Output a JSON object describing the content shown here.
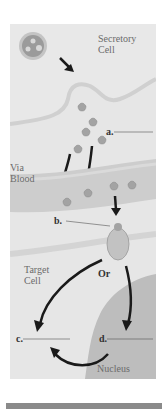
{
  "diagram": {
    "labels": {
      "secretory_cell_line1": "Secretory",
      "secretory_cell_line2": "Cell",
      "via_blood_line1": "Via",
      "via_blood_line2": "Blood",
      "target_cell_line1": "Target",
      "target_cell_line2": "Cell",
      "or": "Or",
      "nucleus": "Nucleus"
    },
    "blanks": {
      "a": "a.",
      "b": "b.",
      "c": "c.",
      "d": "d."
    },
    "colors": {
      "background": "#e6e6e6",
      "membrane": "#d2d2d2",
      "blood_vessel": "#cfcfcf",
      "nucleus": "#bdbdbd",
      "arrow": "#1a1a1a",
      "vesicle": "#9a9a9a"
    }
  }
}
